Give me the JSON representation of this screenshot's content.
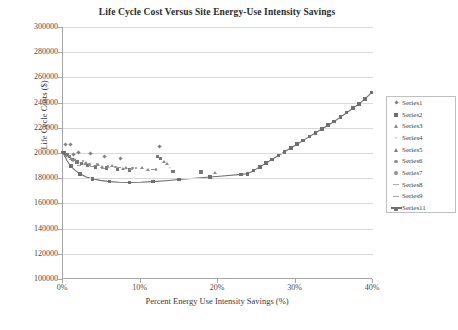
{
  "chart_data": {
    "type": "scatter",
    "title": "Life Cycle Cost Versus Site Energy-Use Intensity Savings",
    "xlabel": "Percent Energy Use Intensity Savings (%)",
    "ylabel": "Life Cycle Costs ($)",
    "xlim": [
      0,
      40
    ],
    "ylim": [
      100000,
      300000
    ],
    "grid": true,
    "legend_position": "right",
    "xticks": [
      "0%",
      "10%",
      "20%",
      "30%",
      "40%"
    ],
    "xtick_values": [
      0,
      10,
      20,
      30,
      40
    ],
    "yticks": [
      "100000",
      "120000",
      "140000",
      "160000",
      "180000",
      "200000",
      "220000",
      "240000",
      "260000",
      "280000",
      "300000"
    ],
    "ytick_values": [
      100000,
      120000,
      140000,
      160000,
      180000,
      200000,
      220000,
      240000,
      260000,
      280000,
      300000
    ],
    "series": [
      {
        "name": "Series1",
        "marker": "diamond",
        "points": [
          [
            0.3,
            207000
          ],
          [
            1.0,
            206500
          ],
          [
            2.0,
            200500
          ],
          [
            3.6,
            199500
          ],
          [
            5.3,
            197500
          ],
          [
            7.4,
            196000
          ],
          [
            12.4,
            205000
          ],
          [
            1.4,
            199000
          ]
        ]
      },
      {
        "name": "Series2",
        "marker": "square",
        "points": [
          [
            0.2,
            200000
          ],
          [
            0.5,
            199000
          ],
          [
            0.8,
            197000
          ],
          [
            1.2,
            195000
          ],
          [
            1.8,
            193000
          ],
          [
            2.4,
            191500
          ],
          [
            3.2,
            190000
          ],
          [
            4.2,
            189000
          ],
          [
            5.6,
            188000
          ],
          [
            7.0,
            187000
          ],
          [
            8.6,
            186500
          ],
          [
            12.2,
            197000
          ],
          [
            12.6,
            195500
          ],
          [
            14.2,
            185500
          ],
          [
            17.8,
            185000
          ]
        ]
      },
      {
        "name": "Series3",
        "marker": "triangle",
        "points": [
          [
            0.4,
            198000
          ],
          [
            1.6,
            194500
          ],
          [
            3.0,
            192000
          ],
          [
            4.6,
            190500
          ],
          [
            6.4,
            189500
          ],
          [
            8.2,
            188500
          ],
          [
            10.2,
            188000
          ],
          [
            13.0,
            193000
          ],
          [
            13.4,
            191000
          ],
          [
            19.6,
            184500
          ]
        ]
      },
      {
        "name": "Series4",
        "marker": "x",
        "points": [
          [
            0.6,
            196000
          ],
          [
            2.2,
            192500
          ],
          [
            4.0,
            190000
          ],
          [
            6.0,
            188500
          ],
          [
            8.0,
            187500
          ],
          [
            10.8,
            187000
          ],
          [
            13.8,
            188000
          ]
        ]
      },
      {
        "name": "Series5",
        "marker": "triangle-filled",
        "points": [
          [
            1.1,
            195500
          ],
          [
            2.8,
            191500
          ],
          [
            5.0,
            189000
          ],
          [
            7.8,
            187500
          ],
          [
            11.0,
            186500
          ]
        ]
      },
      {
        "name": "Series6",
        "marker": "circle",
        "points": [
          [
            0.9,
            197500
          ],
          [
            2.6,
            193500
          ],
          [
            4.4,
            191000
          ],
          [
            6.8,
            189000
          ],
          [
            9.4,
            188000
          ],
          [
            12.0,
            187000
          ]
        ]
      },
      {
        "name": "Series7",
        "marker": "circle",
        "points": [
          [
            1.3,
            194000
          ],
          [
            3.4,
            191000
          ],
          [
            5.8,
            189500
          ],
          [
            9.0,
            188200
          ]
        ]
      },
      {
        "name": "Series8",
        "marker": "dash",
        "points": [
          [
            2.0,
            190000
          ],
          [
            5.2,
            188000
          ],
          [
            8.8,
            187200
          ]
        ]
      },
      {
        "name": "Series9",
        "marker": "dash",
        "points": [
          [
            3.8,
            189500
          ],
          [
            7.2,
            188200
          ],
          [
            11.6,
            186800
          ]
        ]
      },
      {
        "name": "Series11",
        "marker": "line-square",
        "points": [
          [
            0.0,
            200500
          ],
          [
            0.5,
            194000
          ],
          [
            1.0,
            189500
          ],
          [
            1.6,
            186000
          ],
          [
            2.2,
            183500
          ],
          [
            3.0,
            181000
          ],
          [
            3.8,
            179500
          ],
          [
            4.8,
            178300
          ],
          [
            6.0,
            177300
          ],
          [
            7.2,
            176800
          ],
          [
            8.6,
            176600
          ],
          [
            10.0,
            176800
          ],
          [
            11.6,
            177300
          ],
          [
            13.2,
            178000
          ],
          [
            15.0,
            179000
          ],
          [
            17.0,
            180000
          ],
          [
            19.0,
            181000
          ],
          [
            21.0,
            182000
          ],
          [
            23.0,
            183000
          ],
          [
            23.8,
            183500
          ],
          [
            24.6,
            186000
          ],
          [
            25.4,
            189000
          ],
          [
            26.2,
            192000
          ],
          [
            27.0,
            195000
          ],
          [
            27.8,
            198000
          ],
          [
            28.6,
            201000
          ],
          [
            29.4,
            204000
          ],
          [
            30.2,
            207000
          ],
          [
            31.0,
            210000
          ],
          [
            31.8,
            213000
          ],
          [
            32.6,
            216000
          ],
          [
            33.4,
            219000
          ],
          [
            34.2,
            222000
          ],
          [
            35.0,
            225000
          ],
          [
            35.8,
            228500
          ],
          [
            36.6,
            232000
          ],
          [
            37.4,
            235500
          ],
          [
            38.2,
            239000
          ],
          [
            39.0,
            243000
          ],
          [
            39.8,
            248000
          ]
        ]
      }
    ]
  },
  "legend": {
    "entries": [
      {
        "label": "Series1",
        "marker": "diamond"
      },
      {
        "label": "Series2",
        "marker": "square"
      },
      {
        "label": "Series3",
        "marker": "triangle"
      },
      {
        "label": "Series4",
        "marker": "x"
      },
      {
        "label": "Series5",
        "marker": "triangle-filled"
      },
      {
        "label": "Series6",
        "marker": "circle"
      },
      {
        "label": "Series7",
        "marker": "circle"
      },
      {
        "label": "Series8",
        "marker": "dash"
      },
      {
        "label": "Series9",
        "marker": "dash"
      },
      {
        "label": "Series11",
        "marker": "line-square"
      }
    ]
  },
  "colors": {
    "marker_gray": "#808080",
    "curve_gray": "#6f6f6f",
    "grid": "#d9d9d9",
    "axis": "#a6a6a6",
    "text": "#3a3a3a"
  }
}
